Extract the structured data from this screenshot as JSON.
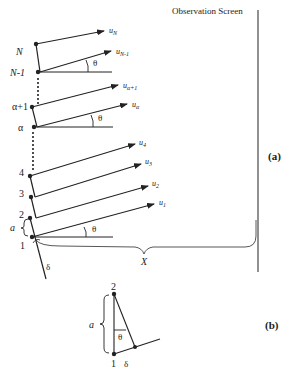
{
  "diagram": {
    "screen_label": "Observation Screen",
    "panel_a_label": "(a)",
    "panel_b_label": "(b)",
    "distance_label": "X",
    "spacing_label": "a",
    "offset_label": "δ",
    "angle_label": "θ",
    "points": [
      {
        "id": "N",
        "label": "N"
      },
      {
        "id": "N-1",
        "label": "N-1"
      },
      {
        "id": "alpha+1",
        "label": "α+1"
      },
      {
        "id": "alpha",
        "label": "α"
      },
      {
        "id": "4",
        "label": "4"
      },
      {
        "id": "3",
        "label": "3"
      },
      {
        "id": "2",
        "label": "2"
      },
      {
        "id": "1",
        "label": "1"
      }
    ],
    "vectors": [
      {
        "id": "uN",
        "base": "u",
        "sub": "N"
      },
      {
        "id": "uN-1",
        "base": "u",
        "sub": "N-1"
      },
      {
        "id": "ualpha+1",
        "base": "u",
        "sub": "α+1"
      },
      {
        "id": "ualpha",
        "base": "u",
        "sub": "α"
      },
      {
        "id": "u4",
        "base": "u",
        "sub": "4"
      },
      {
        "id": "u3",
        "base": "u",
        "sub": "3"
      },
      {
        "id": "u2",
        "base": "u",
        "sub": "2"
      },
      {
        "id": "u1",
        "base": "u",
        "sub": "1"
      }
    ],
    "inset": {
      "top_point": "2",
      "bottom_point": "1",
      "spacing_label": "a",
      "angle_label": "θ",
      "offset_label": "δ"
    },
    "colors": {
      "ink": "#222222",
      "screen": "#555555"
    }
  }
}
